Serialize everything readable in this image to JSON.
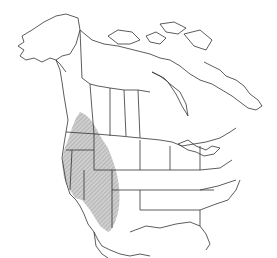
{
  "map": {
    "type": "species-range-map",
    "region": "North America",
    "colors": {
      "background": "#ffffff",
      "land": "#ffffff",
      "borders": "#333333",
      "range_fill": "#c8c8c8",
      "range_hatch": "#888888"
    },
    "legend": [],
    "labels": [],
    "range": {
      "description": "Western North America: southern British Columbia/Alberta south through the western US states into Baja California and northwestern Mexico"
    }
  }
}
